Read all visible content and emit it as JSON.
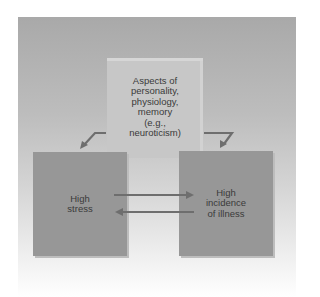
{
  "diagram": {
    "top_box": {
      "lines": [
        "Aspects of",
        "personality,",
        "physiology,",
        "memory",
        "(e.g.,",
        "neuroticism)"
      ]
    },
    "left_box": {
      "lines": [
        "High",
        "stress"
      ]
    },
    "right_box": {
      "lines": [
        "High",
        "incidence",
        "of illness"
      ]
    },
    "arrows": [
      {
        "from": "top_box",
        "to": "left_box",
        "style": "bent-down-left"
      },
      {
        "from": "top_box",
        "to": "right_box",
        "style": "bent-down-right"
      },
      {
        "from": "left_box",
        "to": "right_box",
        "style": "straight"
      },
      {
        "from": "right_box",
        "to": "left_box",
        "style": "straight"
      }
    ],
    "colors": {
      "background_gradient_top": "#a9a9a9",
      "background_gradient_bottom": "#ffffff",
      "top_box": "#c7c7c7",
      "side_boxes": "#979797",
      "arrows": "#6e6e6e",
      "text": "#3a3a3a"
    }
  }
}
